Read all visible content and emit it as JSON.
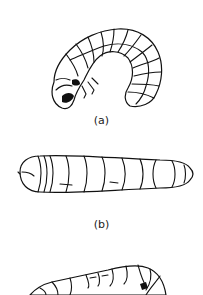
{
  "figure": {
    "panels": [
      {
        "id": "a",
        "label": "(a)",
        "subject": "C-shaped curled larva (grub), lateral view"
      },
      {
        "id": "b",
        "label": "(b)",
        "subject": "straight elongated larva, dorsal view"
      },
      {
        "id": "c",
        "label": "",
        "subject": "curved segmented larva, partially visible"
      }
    ]
  },
  "colors": {
    "line": "#111111",
    "background": "#ffffff"
  }
}
